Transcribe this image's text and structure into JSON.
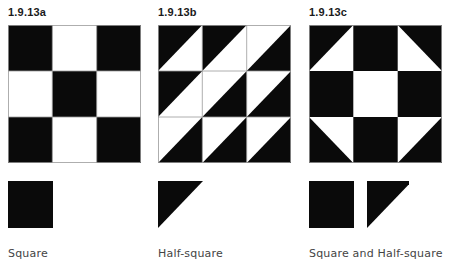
{
  "colors": {
    "black": "#0a0a0a",
    "white": "#ffffff",
    "gridline": "#9a9a9a"
  },
  "figures": [
    {
      "id_label": "1.9.13a",
      "caption": "Square",
      "description": "Nine-patch checkerboard of solid squares",
      "cells": [
        [
          "black",
          "white",
          "black"
        ],
        [
          "white",
          "black",
          "white"
        ],
        [
          "black",
          "white",
          "black"
        ]
      ],
      "legend": [
        "square"
      ]
    },
    {
      "id_label": "1.9.13b",
      "caption": "Half-square",
      "description": "Grid of half-square triangles, diagonal from bottom-left to top-right",
      "cells": [
        [
          "tl-black",
          "tl-black",
          "br-black"
        ],
        [
          "tl-black",
          "br-black",
          "br-black"
        ],
        [
          "br-black",
          "br-black",
          "br-black"
        ]
      ],
      "legend": [
        "half-square"
      ]
    },
    {
      "id_label": "1.9.13c",
      "caption": "Square and Half-square",
      "description": "Shoofly block combining squares and half-square triangles",
      "cells": [
        [
          "tl-black",
          "black",
          "tr-black"
        ],
        [
          "black",
          "white",
          "black"
        ],
        [
          "bl-black",
          "black",
          "br-black"
        ]
      ],
      "legend": [
        "square",
        "half-square"
      ]
    }
  ]
}
